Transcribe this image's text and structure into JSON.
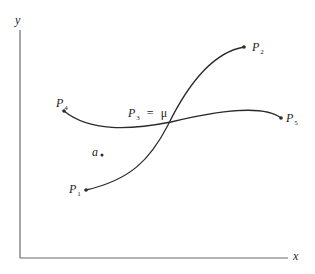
{
  "diagram": {
    "axes": {
      "x_label": "x",
      "y_label": "y",
      "color": "#6b6b6b"
    },
    "curve_color": "#2a2a2a",
    "points": [
      {
        "id": "P1",
        "base": "P",
        "sub": "1"
      },
      {
        "id": "P2",
        "base": "P",
        "sub": "2"
      },
      {
        "id": "P3",
        "base": "P",
        "sub": "3"
      },
      {
        "id": "P4",
        "base": "P",
        "sub": "4"
      },
      {
        "id": "P5",
        "base": "P",
        "sub": "5"
      }
    ],
    "intersection_label": {
      "eq": "=",
      "symbol": "μ"
    },
    "point_a": {
      "label": "a"
    },
    "curves": [
      {
        "name": "curve-P1-P2",
        "from": "P1",
        "to": "P2"
      },
      {
        "name": "curve-P4-P5",
        "from": "P4",
        "to": "P5"
      }
    ]
  }
}
